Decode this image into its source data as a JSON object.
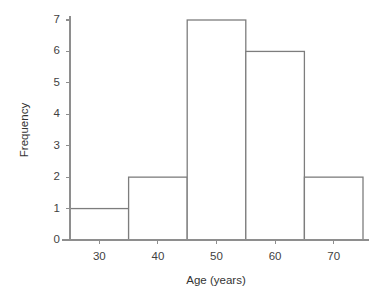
{
  "chart_data": {
    "type": "bar",
    "title": "",
    "subtitle": "",
    "xlabel": "Age (years)",
    "ylabel": "Frequency",
    "categories": [
      "25–35",
      "35–45",
      "45–55",
      "55–65",
      "65–75"
    ],
    "bin_edges": [
      25,
      35,
      45,
      55,
      65,
      75
    ],
    "values": [
      1,
      2,
      7,
      6,
      2
    ],
    "bin_width": 10,
    "xlim": [
      25,
      75
    ],
    "ylim": [
      0,
      7
    ],
    "xticks": [
      30,
      40,
      50,
      60,
      70
    ],
    "xtick_labels": [
      "30",
      "40",
      "50",
      "60",
      "70"
    ],
    "yticks": [
      0,
      1,
      2,
      3,
      4,
      5,
      6,
      7
    ],
    "ytick_labels": [
      "0",
      "1",
      "2",
      "3",
      "4",
      "5",
      "6",
      "7"
    ],
    "grid": false,
    "legend": null,
    "bar_fill_color": "#ffffff",
    "bar_edge_color": "#7d7d7d",
    "axis_color": "#8e8e8e",
    "text_color": "#3a3a3a",
    "background_color": "#ffffff",
    "total_count": 18
  },
  "axes": {
    "x_title": "Age (years)",
    "y_title": "Frequency"
  }
}
